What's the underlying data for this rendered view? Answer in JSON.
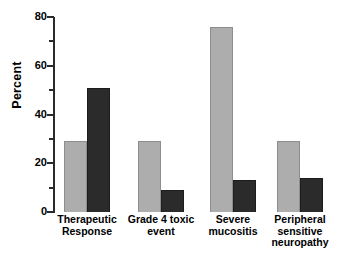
{
  "chart_data": {
    "type": "bar",
    "title": "",
    "xlabel": "",
    "ylabel": "Percent",
    "ylim": [
      0,
      80
    ],
    "ytick_labels": [
      "0",
      "20",
      "40",
      "60",
      "80"
    ],
    "ytick_values": [
      0,
      20,
      40,
      60,
      80
    ],
    "yminor_values": [
      10,
      30,
      50,
      70
    ],
    "grid": false,
    "legend": "none",
    "categories": [
      "Therapeutic\nResponse",
      "Grade 4 toxic\nevent",
      "Severe\nmucositis",
      "Peripheral\nsensitive\nneuropathy"
    ],
    "series": [
      {
        "name": "gray-series",
        "color": "#adadad",
        "values": [
          29,
          29,
          76,
          29
        ]
      },
      {
        "name": "dark-series",
        "color": "#2b2b2b",
        "values": [
          51,
          9,
          13,
          14
        ]
      }
    ]
  },
  "axis": {
    "line_color": "#2b2b2b"
  }
}
